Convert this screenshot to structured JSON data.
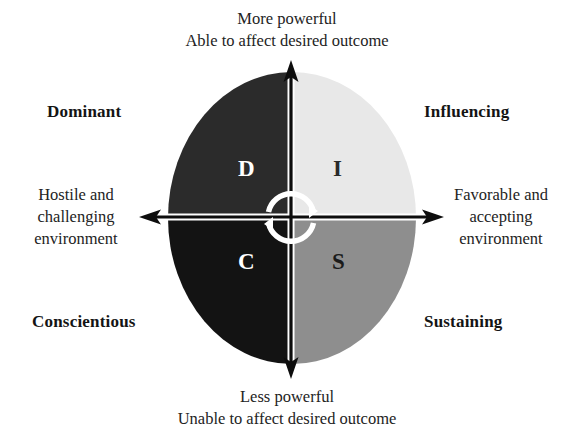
{
  "diagram": {
    "axes": {
      "top": {
        "line1": "More powerful",
        "line2": "Able to affect desired outcome"
      },
      "bottom": {
        "line1": "Less powerful",
        "line2": "Unable to affect desired outcome"
      },
      "left": {
        "line1": "Hostile and",
        "line2": "challenging",
        "line3": "environment"
      },
      "right": {
        "line1": "Favorable and",
        "line2": "accepting",
        "line3": "environment"
      }
    },
    "quadrants": [
      {
        "key": "D",
        "letter": "D",
        "label": "Dominant",
        "position": "top-left",
        "fill": "#2b2b2b",
        "letter_color": "#ffffff"
      },
      {
        "key": "I",
        "letter": "I",
        "label": "Influencing",
        "position": "top-right",
        "fill": "#e8e8e8",
        "letter_color": "#2a2a2a"
      },
      {
        "key": "C",
        "letter": "C",
        "label": "Conscientious",
        "position": "bottom-left",
        "fill": "#131313",
        "letter_color": "#ffffff"
      },
      {
        "key": "S",
        "letter": "S",
        "label": "Sustaining",
        "position": "bottom-right",
        "fill": "#8e8e8e",
        "letter_color": "#1b1b1b"
      }
    ],
    "center_icon": {
      "name": "rotation-arrows-icon",
      "color": "#ffffff"
    },
    "colors": {
      "axis_line": "#0d0d0d",
      "axis_outline": "#ffffff",
      "background": "#ffffff",
      "text": "#232323",
      "label_text": "#141414"
    }
  }
}
